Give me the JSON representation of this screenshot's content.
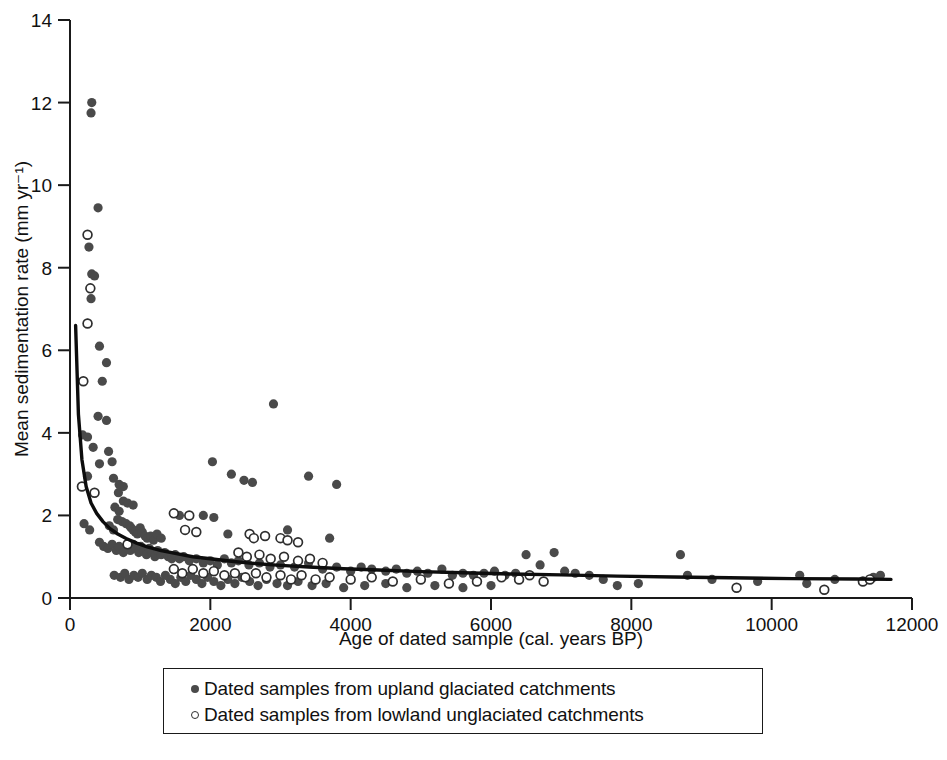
{
  "chart_data": {
    "type": "scatter",
    "title": "",
    "xlabel": "Age of dated sample (cal. years BP)",
    "ylabel": "Mean sedimentation rate (mm yr⁻¹)",
    "xlim": [
      0,
      12000
    ],
    "ylim": [
      0,
      14
    ],
    "xticks": [
      0,
      2000,
      4000,
      6000,
      8000,
      10000,
      12000
    ],
    "xtick_labels": [
      "0",
      "2000",
      "4000",
      "6000",
      "8000",
      "10000",
      "12000"
    ],
    "yticks": [
      0,
      2,
      4,
      6,
      8,
      10,
      12,
      14
    ],
    "ytick_labels": [
      "0",
      "2",
      "4",
      "6",
      "8",
      "10",
      "12",
      "14"
    ],
    "grid": false,
    "legend_position": "below-axes",
    "marker_colors": {
      "upland_filled": "#4a4a4a",
      "lowland_open_edge": "#2e2e2e",
      "fit_curve": "#0d0d0d"
    },
    "series": [
      {
        "name": "Dated samples from upland glaciated catchments",
        "marker": "filled-circle",
        "color": "#4a4a4a",
        "points": [
          [
            310,
            12.0
          ],
          [
            300,
            11.75
          ],
          [
            400,
            9.45
          ],
          [
            270,
            8.5
          ],
          [
            310,
            7.85
          ],
          [
            350,
            7.8
          ],
          [
            300,
            7.25
          ],
          [
            250,
            6.65
          ],
          [
            420,
            6.1
          ],
          [
            520,
            5.7
          ],
          [
            460,
            5.25
          ],
          [
            400,
            4.4
          ],
          [
            180,
            3.95
          ],
          [
            250,
            3.9
          ],
          [
            520,
            4.3
          ],
          [
            330,
            3.65
          ],
          [
            550,
            3.55
          ],
          [
            2900,
            4.7
          ],
          [
            2030,
            3.3
          ],
          [
            2300,
            3.0
          ],
          [
            420,
            3.25
          ],
          [
            600,
            3.3
          ],
          [
            250,
            2.95
          ],
          [
            620,
            2.9
          ],
          [
            700,
            2.75
          ],
          [
            760,
            2.7
          ],
          [
            690,
            2.55
          ],
          [
            2480,
            2.85
          ],
          [
            2600,
            2.8
          ],
          [
            3400,
            2.95
          ],
          [
            3800,
            2.75
          ],
          [
            760,
            2.35
          ],
          [
            820,
            2.3
          ],
          [
            640,
            2.2
          ],
          [
            900,
            2.25
          ],
          [
            700,
            2.1
          ],
          [
            1490,
            2.05
          ],
          [
            1560,
            2.0
          ],
          [
            1900,
            2.0
          ],
          [
            2050,
            1.95
          ],
          [
            200,
            1.8
          ],
          [
            280,
            1.65
          ],
          [
            560,
            1.75
          ],
          [
            620,
            1.65
          ],
          [
            680,
            1.9
          ],
          [
            740,
            1.85
          ],
          [
            800,
            1.8
          ],
          [
            850,
            1.75
          ],
          [
            870,
            1.7
          ],
          [
            900,
            1.65
          ],
          [
            930,
            1.6
          ],
          [
            960,
            1.55
          ],
          [
            1000,
            1.7
          ],
          [
            1030,
            1.6
          ],
          [
            1070,
            1.5
          ],
          [
            1100,
            1.45
          ],
          [
            1150,
            1.5
          ],
          [
            1190,
            1.4
          ],
          [
            1240,
            1.55
          ],
          [
            1300,
            1.45
          ],
          [
            2250,
            1.55
          ],
          [
            3100,
            1.65
          ],
          [
            3700,
            1.45
          ],
          [
            420,
            1.35
          ],
          [
            480,
            1.25
          ],
          [
            540,
            1.2
          ],
          [
            600,
            1.3
          ],
          [
            660,
            1.15
          ],
          [
            700,
            1.25
          ],
          [
            760,
            1.1
          ],
          [
            810,
            1.2
          ],
          [
            860,
            1.15
          ],
          [
            900,
            1.3
          ],
          [
            940,
            1.2
          ],
          [
            980,
            1.1
          ],
          [
            1010,
            1.25
          ],
          [
            1050,
            1.15
          ],
          [
            1090,
            1.05
          ],
          [
            1130,
            1.2
          ],
          [
            1170,
            1.1
          ],
          [
            1210,
            1.0
          ],
          [
            1250,
            1.15
          ],
          [
            1300,
            1.05
          ],
          [
            1350,
            1.1
          ],
          [
            1400,
            1.0
          ],
          [
            1450,
            0.95
          ],
          [
            1500,
            1.05
          ],
          [
            1560,
            0.95
          ],
          [
            1620,
            1.0
          ],
          [
            1700,
            0.9
          ],
          [
            1800,
            0.95
          ],
          [
            1900,
            0.85
          ],
          [
            2000,
            0.9
          ],
          [
            2100,
            0.8
          ],
          [
            2200,
            0.95
          ],
          [
            2300,
            0.85
          ],
          [
            2400,
            0.9
          ],
          [
            2550,
            0.8
          ],
          [
            2700,
            0.85
          ],
          [
            2850,
            0.75
          ],
          [
            3000,
            0.8
          ],
          [
            3200,
            0.75
          ],
          [
            3400,
            0.85
          ],
          [
            3600,
            0.7
          ],
          [
            3800,
            0.75
          ],
          [
            4000,
            0.65
          ],
          [
            4150,
            0.75
          ],
          [
            4300,
            0.7
          ],
          [
            4500,
            0.65
          ],
          [
            4650,
            0.7
          ],
          [
            4800,
            0.6
          ],
          [
            4950,
            0.65
          ],
          [
            5100,
            0.6
          ],
          [
            5300,
            0.7
          ],
          [
            5450,
            0.55
          ],
          [
            5600,
            0.6
          ],
          [
            5750,
            0.55
          ],
          [
            5900,
            0.6
          ],
          [
            6050,
            0.65
          ],
          [
            6200,
            0.55
          ],
          [
            6350,
            0.6
          ],
          [
            6500,
            1.05
          ],
          [
            6700,
            0.8
          ],
          [
            6900,
            1.1
          ],
          [
            7050,
            0.65
          ],
          [
            7200,
            0.6
          ],
          [
            7400,
            0.55
          ],
          [
            7600,
            0.45
          ],
          [
            7800,
            0.3
          ],
          [
            8100,
            0.35
          ],
          [
            8700,
            1.05
          ],
          [
            8800,
            0.55
          ],
          [
            9150,
            0.45
          ],
          [
            9800,
            0.4
          ],
          [
            10400,
            0.55
          ],
          [
            10500,
            0.35
          ],
          [
            10900,
            0.45
          ],
          [
            11450,
            0.5
          ],
          [
            11550,
            0.55
          ],
          [
            630,
            0.55
          ],
          [
            720,
            0.5
          ],
          [
            780,
            0.6
          ],
          [
            840,
            0.45
          ],
          [
            910,
            0.55
          ],
          [
            970,
            0.5
          ],
          [
            1030,
            0.6
          ],
          [
            1100,
            0.45
          ],
          [
            1160,
            0.55
          ],
          [
            1230,
            0.5
          ],
          [
            1290,
            0.4
          ],
          [
            1360,
            0.55
          ],
          [
            1430,
            0.45
          ],
          [
            1500,
            0.35
          ],
          [
            1580,
            0.5
          ],
          [
            1650,
            0.4
          ],
          [
            1720,
            0.55
          ],
          [
            1800,
            0.45
          ],
          [
            1880,
            0.35
          ],
          [
            1960,
            0.5
          ],
          [
            2050,
            0.4
          ],
          [
            2150,
            0.3
          ],
          [
            2250,
            0.45
          ],
          [
            2350,
            0.35
          ],
          [
            2450,
            0.5
          ],
          [
            2560,
            0.4
          ],
          [
            2680,
            0.3
          ],
          [
            2800,
            0.45
          ],
          [
            2950,
            0.35
          ],
          [
            3100,
            0.3
          ],
          [
            3250,
            0.4
          ],
          [
            3450,
            0.3
          ],
          [
            3650,
            0.35
          ],
          [
            3900,
            0.25
          ],
          [
            4200,
            0.3
          ],
          [
            4500,
            0.35
          ],
          [
            4800,
            0.25
          ],
          [
            5200,
            0.3
          ],
          [
            5600,
            0.25
          ],
          [
            6000,
            0.3
          ]
        ]
      },
      {
        "name": "Dated samples from lowland unglaciated catchments",
        "marker": "open-circle",
        "color": "#ffffff",
        "points": [
          [
            250,
            8.8
          ],
          [
            290,
            7.5
          ],
          [
            250,
            6.65
          ],
          [
            190,
            5.25
          ],
          [
            170,
            2.7
          ],
          [
            350,
            2.55
          ],
          [
            1480,
            2.05
          ],
          [
            1700,
            2.0
          ],
          [
            1640,
            1.65
          ],
          [
            1800,
            1.6
          ],
          [
            820,
            1.3
          ],
          [
            2560,
            1.55
          ],
          [
            2620,
            1.45
          ],
          [
            2780,
            1.5
          ],
          [
            3000,
            1.45
          ],
          [
            3100,
            1.4
          ],
          [
            3250,
            1.35
          ],
          [
            2400,
            1.1
          ],
          [
            2520,
            1.0
          ],
          [
            2700,
            1.05
          ],
          [
            2860,
            0.95
          ],
          [
            3050,
            1.0
          ],
          [
            3250,
            0.9
          ],
          [
            3420,
            0.95
          ],
          [
            3600,
            0.85
          ],
          [
            1480,
            0.7
          ],
          [
            1600,
            0.6
          ],
          [
            1750,
            0.7
          ],
          [
            1900,
            0.6
          ],
          [
            2050,
            0.65
          ],
          [
            2200,
            0.55
          ],
          [
            2350,
            0.6
          ],
          [
            2500,
            0.5
          ],
          [
            2650,
            0.6
          ],
          [
            2800,
            0.5
          ],
          [
            3000,
            0.55
          ],
          [
            3150,
            0.45
          ],
          [
            3300,
            0.55
          ],
          [
            3500,
            0.45
          ],
          [
            3700,
            0.5
          ],
          [
            4000,
            0.45
          ],
          [
            4300,
            0.5
          ],
          [
            4600,
            0.4
          ],
          [
            5000,
            0.45
          ],
          [
            5400,
            0.35
          ],
          [
            5800,
            0.4
          ],
          [
            6150,
            0.5
          ],
          [
            6400,
            0.45
          ],
          [
            6550,
            0.55
          ],
          [
            6750,
            0.4
          ],
          [
            9500,
            0.25
          ],
          [
            10750,
            0.2
          ],
          [
            11300,
            0.4
          ],
          [
            11400,
            0.45
          ]
        ]
      }
    ],
    "fit_curve": {
      "name": "power-law fit",
      "color": "#0d0d0d",
      "points": [
        [
          80,
          6.6
        ],
        [
          120,
          4.45
        ],
        [
          170,
          3.35
        ],
        [
          230,
          2.7
        ],
        [
          300,
          2.3
        ],
        [
          380,
          2.05
        ],
        [
          470,
          1.85
        ],
        [
          570,
          1.68
        ],
        [
          680,
          1.55
        ],
        [
          800,
          1.44
        ],
        [
          950,
          1.33
        ],
        [
          1100,
          1.24
        ],
        [
          1300,
          1.15
        ],
        [
          1500,
          1.08
        ],
        [
          1750,
          1.0
        ],
        [
          2000,
          0.95
        ],
        [
          2300,
          0.89
        ],
        [
          2600,
          0.84
        ],
        [
          3000,
          0.79
        ],
        [
          3400,
          0.75
        ],
        [
          3900,
          0.71
        ],
        [
          4400,
          0.68
        ],
        [
          5000,
          0.64
        ],
        [
          5600,
          0.61
        ],
        [
          6300,
          0.58
        ],
        [
          7000,
          0.56
        ],
        [
          7800,
          0.53
        ],
        [
          8600,
          0.51
        ],
        [
          9400,
          0.49
        ],
        [
          10300,
          0.47
        ],
        [
          11200,
          0.46
        ],
        [
          11700,
          0.45
        ]
      ]
    }
  },
  "legend": {
    "items": [
      {
        "marker": "filled-circle",
        "label": "Dated samples from upland glaciated catchments"
      },
      {
        "marker": "open-circle",
        "label": "Dated samples from lowland unglaciated catchments"
      }
    ]
  }
}
